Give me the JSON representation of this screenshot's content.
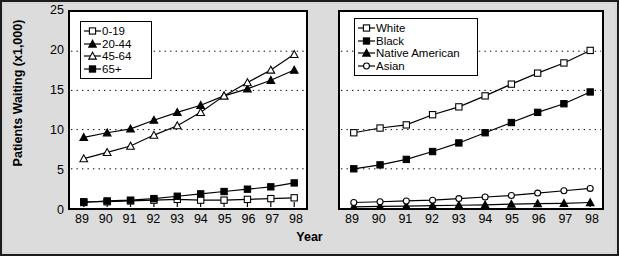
{
  "figure": {
    "xlabel": "Year",
    "ylabel": "Patients Waiting (x1,000)",
    "yticks": [
      "0",
      "5",
      "10",
      "15",
      "20",
      "25"
    ],
    "xticks": [
      "89",
      "90",
      "91",
      "92",
      "93",
      "94",
      "95",
      "96",
      "97",
      "98"
    ],
    "colors": {
      "ink": "#000000",
      "plot_background": "#ffffff",
      "figure_background": "#d7d7d7",
      "gridline": "#000000"
    }
  },
  "chart_data": [
    {
      "type": "line",
      "panel": "left",
      "title": "",
      "xlabel": "Year",
      "ylabel": "Patients Waiting (x1,000)",
      "x": [
        "89",
        "90",
        "91",
        "92",
        "93",
        "94",
        "95",
        "96",
        "97",
        "98"
      ],
      "xlim": [
        89,
        98
      ],
      "ylim": [
        0,
        25
      ],
      "yticks": [
        0,
        5,
        10,
        15,
        20,
        25
      ],
      "grid": "horizontal-dotted",
      "legend_position": "top-left",
      "series": [
        {
          "name": "0-19",
          "marker": "open-square",
          "values": [
            0.8,
            0.8,
            0.9,
            1.0,
            1.1,
            1.0,
            1.0,
            1.1,
            1.2,
            1.3
          ]
        },
        {
          "name": "20-44",
          "marker": "filled-triangle",
          "values": [
            9.0,
            9.6,
            10.1,
            11.2,
            12.2,
            13.1,
            14.3,
            15.2,
            16.3,
            17.6
          ]
        },
        {
          "name": "45-64",
          "marker": "open-triangle",
          "values": [
            6.3,
            7.1,
            7.9,
            9.3,
            10.5,
            12.2,
            14.3,
            16.0,
            17.6,
            19.6
          ]
        },
        {
          "name": "65+",
          "marker": "filled-square",
          "values": [
            0.7,
            0.9,
            1.0,
            1.2,
            1.5,
            1.8,
            2.1,
            2.4,
            2.7,
            3.2
          ]
        }
      ]
    },
    {
      "type": "line",
      "panel": "right",
      "title": "",
      "xlabel": "Year",
      "ylabel": "Patients Waiting (x1,000)",
      "x": [
        "89",
        "90",
        "91",
        "92",
        "93",
        "94",
        "95",
        "96",
        "97",
        "98"
      ],
      "xlim": [
        89,
        98
      ],
      "ylim": [
        0,
        25
      ],
      "yticks": [
        0,
        5,
        10,
        15,
        20,
        25
      ],
      "grid": "horizontal-dotted",
      "legend_position": "top-left",
      "series": [
        {
          "name": "White",
          "marker": "open-square",
          "values": [
            9.6,
            10.2,
            10.6,
            11.9,
            12.9,
            14.3,
            15.8,
            17.2,
            18.5,
            20.1
          ]
        },
        {
          "name": "Black",
          "marker": "filled-square",
          "values": [
            5.0,
            5.5,
            6.2,
            7.2,
            8.3,
            9.6,
            10.9,
            12.2,
            13.3,
            14.8
          ]
        },
        {
          "name": "Native American",
          "marker": "filled-triangle",
          "values": [
            0.15,
            0.2,
            0.25,
            0.3,
            0.35,
            0.4,
            0.5,
            0.55,
            0.6,
            0.7
          ]
        },
        {
          "name": "Asian",
          "marker": "open-circle",
          "values": [
            0.7,
            0.8,
            0.9,
            1.0,
            1.2,
            1.4,
            1.6,
            1.9,
            2.2,
            2.5
          ]
        }
      ]
    }
  ],
  "legends": {
    "left": {
      "items": [
        {
          "label": "0-19",
          "marker": "open-square"
        },
        {
          "label": "20-44",
          "marker": "filled-triangle"
        },
        {
          "label": "45-64",
          "marker": "open-triangle"
        },
        {
          "label": "65+",
          "marker": "filled-square"
        }
      ]
    },
    "right": {
      "items": [
        {
          "label": "White",
          "marker": "open-square"
        },
        {
          "label": "Black",
          "marker": "filled-square"
        },
        {
          "label": "Native American",
          "marker": "filled-triangle"
        },
        {
          "label": "Asian",
          "marker": "open-circle"
        }
      ]
    }
  }
}
